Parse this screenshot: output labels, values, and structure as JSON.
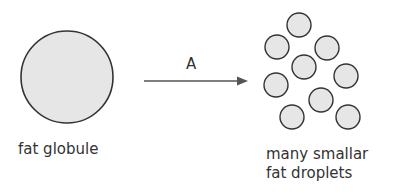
{
  "diagram": {
    "arrow_label": "A",
    "left_label": "fat globule",
    "right_label_line1": "many smallar",
    "right_label_line2": "fat droplets"
  },
  "colors": {
    "fill": "#e6e6e6",
    "stroke": "#333333"
  }
}
